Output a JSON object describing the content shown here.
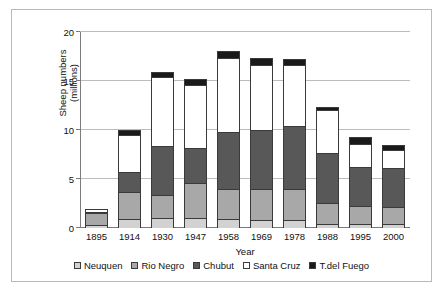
{
  "chart_data": {
    "type": "bar",
    "subtype": "stacked-column",
    "title": "",
    "xlabel": "Year",
    "ylabel": "Sheep numbers (millions)",
    "ylim": [
      0,
      20
    ],
    "yticks": [
      0,
      5,
      10,
      15,
      20
    ],
    "grid": true,
    "legend_position": "bottom",
    "categories": [
      "1895",
      "1914",
      "1930",
      "1947",
      "1958",
      "1969",
      "1978",
      "1988",
      "1995",
      "2000"
    ],
    "series": [
      {
        "name": "Neuquen",
        "color": "#d2d2d2",
        "values": [
          0.2,
          0.8,
          0.9,
          0.9,
          0.8,
          0.7,
          0.7,
          0.3,
          0.3,
          0.3
        ]
      },
      {
        "name": "Rio Negro",
        "color": "#a8a8a8",
        "values": [
          1.2,
          2.8,
          2.4,
          3.6,
          3.1,
          3.2,
          3.2,
          2.2,
          1.8,
          1.7
        ]
      },
      {
        "name": "Chubut",
        "color": "#585858",
        "values": [
          0.1,
          2.0,
          5.0,
          3.6,
          5.8,
          6.0,
          6.4,
          5.1,
          4.0,
          4.0
        ]
      },
      {
        "name": "Santa Cruz",
        "color": "#ffffff",
        "values": [
          0.3,
          3.8,
          7.0,
          6.4,
          7.5,
          6.6,
          6.2,
          4.3,
          2.4,
          1.9
        ]
      },
      {
        "name": "T.del Fuego",
        "color": "#1a1a1a",
        "values": [
          0.0,
          0.5,
          0.5,
          0.6,
          0.8,
          0.7,
          0.6,
          0.3,
          0.7,
          0.5
        ]
      }
    ],
    "totals": [
      1.8,
      9.9,
      15.8,
      15.1,
      18.0,
      17.2,
      17.1,
      12.2,
      9.2,
      8.4
    ]
  },
  "axes": {
    "y_title": "Sheep numbers",
    "y_title_line2": "(millions)",
    "x_title": "Year",
    "ytick_labels": [
      "0",
      "5",
      "10",
      "15",
      "20"
    ]
  },
  "legend": {
    "items": [
      {
        "label": "Neuquen"
      },
      {
        "label": "Rio Negro"
      },
      {
        "label": "Chubut"
      },
      {
        "label": "Santa Cruz"
      },
      {
        "label": "T.del Fuego"
      }
    ]
  }
}
